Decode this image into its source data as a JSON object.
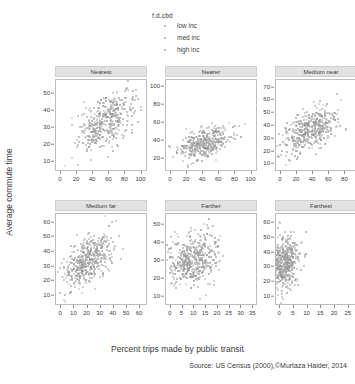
{
  "figure": {
    "ylabel": "Average commute time",
    "xlabel": "Percent trips made by public transit",
    "source": "Source: US Census (2000),©Murtaza Haider, 2014"
  },
  "legend": {
    "title": "f.d.cbd",
    "items": [
      {
        "label": "low inc",
        "color": "#a8a8a8",
        "marker": "dot"
      },
      {
        "label": "med inc",
        "color": "#a8a8a8",
        "marker": "dot"
      },
      {
        "label": "high inc",
        "color": "#a8a8a8",
        "marker": "dot"
      }
    ]
  },
  "chart_data": {
    "type": "scatter",
    "title": "",
    "xlabel": "Percent trips made by public transit",
    "ylabel": "Average commute time",
    "grid": false,
    "legend_position": "top-center",
    "conditioning_variable": "f.d.cbd",
    "series_legend": [
      "low inc",
      "med inc",
      "high inc"
    ],
    "panels": [
      {
        "name": "Nearest",
        "row": 0,
        "col": 0,
        "xticks": [
          0,
          20,
          40,
          60,
          80,
          100
        ],
        "yticks": [
          10,
          20,
          30,
          40,
          50
        ],
        "xlim": [
          -6,
          108
        ],
        "ylim": [
          4,
          58
        ],
        "n_points": 420,
        "cloud": {
          "x_center": 55,
          "y_center": 33,
          "x_spread": 17,
          "y_spread": 8,
          "correlation": 0.45
        },
        "description": "dense elongated cloud rising from lower-left to upper-right"
      },
      {
        "name": "Nearer",
        "row": 0,
        "col": 1,
        "xticks": [
          0,
          20,
          40,
          60,
          80,
          100
        ],
        "yticks": [
          20,
          40,
          60,
          80,
          100
        ],
        "xlim": [
          -6,
          108
        ],
        "ylim": [
          5,
          108
        ],
        "n_points": 400,
        "cloud": {
          "x_center": 42,
          "y_center": 37,
          "x_spread": 16,
          "y_spread": 9,
          "correlation": 0.4
        },
        "description": "dense cloud in lower-left half with sparse high outliers"
      },
      {
        "name": "Medium near",
        "row": 0,
        "col": 2,
        "xticks": [
          0,
          20,
          40,
          60,
          80,
          100
        ],
        "yticks": [
          10,
          20,
          30,
          40,
          50,
          60,
          70
        ],
        "xlim": [
          -6,
          108
        ],
        "ylim": [
          4,
          76
        ],
        "n_points": 430,
        "cloud": {
          "x_center": 36,
          "y_center": 36,
          "x_spread": 17,
          "y_spread": 9,
          "correlation": 0.55
        },
        "description": "strongly positive elongated cloud"
      },
      {
        "name": "Medium far",
        "row": 1,
        "col": 0,
        "xticks": [
          0,
          10,
          20,
          30,
          40,
          50,
          60
        ],
        "yticks": [
          10,
          20,
          30,
          40,
          50,
          60
        ],
        "xlim": [
          -4,
          66
        ],
        "ylim": [
          3,
          66
        ],
        "n_points": 460,
        "cloud": {
          "x_center": 20,
          "y_center": 34,
          "x_spread": 10,
          "y_spread": 9,
          "correlation": 0.55
        },
        "description": "dense positive cloud concentrated at low transit percentages"
      },
      {
        "name": "Farther",
        "row": 1,
        "col": 1,
        "xticks": [
          0,
          5,
          10,
          15,
          20,
          25,
          30,
          35
        ],
        "yticks": [
          10,
          20,
          30,
          40,
          50
        ],
        "xlim": [
          -2,
          37
        ],
        "ylim": [
          5,
          56
        ],
        "n_points": 470,
        "cloud": {
          "x_center": 11,
          "y_center": 31,
          "x_spread": 6,
          "y_spread": 7,
          "correlation": 0.22
        },
        "description": "roughly circular dense blob with weak positive trend"
      },
      {
        "name": "Farthest",
        "row": 1,
        "col": 2,
        "xticks": [
          0,
          5,
          10,
          15,
          20,
          25,
          30
        ],
        "yticks": [
          10,
          20,
          30,
          40,
          50,
          60
        ],
        "xlim": [
          -1.5,
          32
        ],
        "ylim": [
          4,
          66
        ],
        "n_points": 450,
        "cloud": {
          "x_center": 4.5,
          "y_center": 33,
          "x_spread": 4.5,
          "y_spread": 9,
          "correlation": 0.18
        },
        "description": "mass piled against the left axis with a scattered tail to the right"
      }
    ]
  },
  "style": {
    "point_colors": [
      "#9e9e9e",
      "#8f8f8f",
      "#b4b4b4"
    ],
    "strip_background": "#e2e2e2",
    "panel_border": "#bdbdbd",
    "text_color": "#3a3a3a"
  }
}
